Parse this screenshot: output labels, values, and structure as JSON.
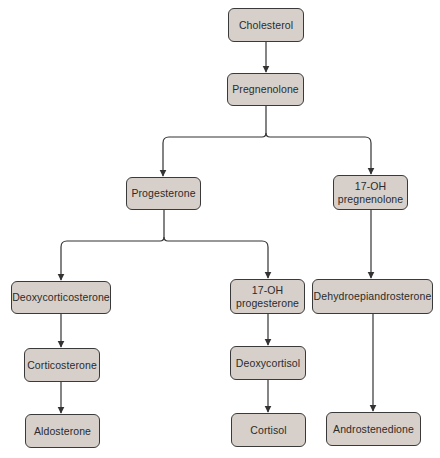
{
  "diagram": {
    "colors": {
      "node_fill": "#d7d0ca",
      "node_border": "#3b3a3a",
      "edge": "#333333",
      "text": "#2b2b2b"
    },
    "nodes": {
      "cholesterol": {
        "label": "Cholesterol"
      },
      "pregnenolone": {
        "label": "Pregnenolone"
      },
      "progesterone": {
        "label": "Progesterone"
      },
      "oh17_pregnenolone": {
        "line1": "17-OH",
        "line2": "pregnenolone"
      },
      "deoxycorticosterone": {
        "label": "Deoxycorticosterone"
      },
      "oh17_progesterone": {
        "line1": "17-OH",
        "line2": "progesterone"
      },
      "dhea": {
        "label": "Dehydroepiandrosterone"
      },
      "corticosterone": {
        "label": "Corticosterone"
      },
      "deoxycortisol": {
        "label": "Deoxycortisol"
      },
      "aldosterone": {
        "label": "Aldosterone"
      },
      "cortisol": {
        "label": "Cortisol"
      },
      "androstenedione": {
        "label": "Androstenedione"
      }
    },
    "edges": [
      [
        "Cholesterol",
        "Pregnenolone"
      ],
      [
        "Pregnenolone",
        "Progesterone"
      ],
      [
        "Pregnenolone",
        "17-OH pregnenolone"
      ],
      [
        "Progesterone",
        "Deoxycorticosterone"
      ],
      [
        "Progesterone",
        "17-OH progesterone"
      ],
      [
        "Deoxycorticosterone",
        "Corticosterone"
      ],
      [
        "Corticosterone",
        "Aldosterone"
      ],
      [
        "17-OH progesterone",
        "Deoxycortisol"
      ],
      [
        "Deoxycortisol",
        "Cortisol"
      ],
      [
        "17-OH pregnenolone",
        "Dehydroepiandrosterone"
      ],
      [
        "Dehydroepiandrosterone",
        "Androstenedione"
      ]
    ]
  }
}
